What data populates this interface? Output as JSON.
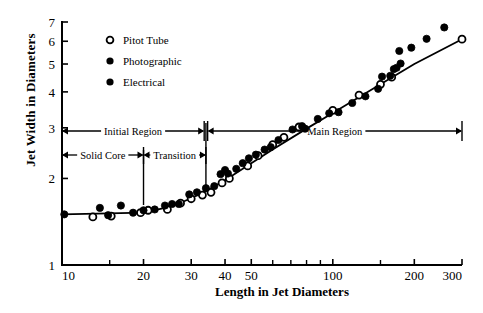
{
  "chart_data": {
    "type": "scatter",
    "title": "",
    "xlabel": "Length in Jet Diameters",
    "ylabel": "Jet Width in Diameters",
    "xscale": "log",
    "yscale": "log",
    "xlim": [
      10,
      300
    ],
    "ylim": [
      1,
      7
    ],
    "grid": false,
    "legend_position": "top-left",
    "xticks_labeled": [
      10,
      20,
      30,
      40,
      50,
      100,
      200,
      300
    ],
    "xticks_minor": [
      15,
      60,
      70,
      80,
      90,
      150
    ],
    "yticks_labeled": [
      1,
      2,
      3,
      4,
      5,
      6,
      7
    ],
    "xtick_labels": [
      "10",
      "20",
      "30",
      "40",
      "50",
      "100",
      "200",
      "300"
    ],
    "ytick_labels": [
      "1",
      "2",
      "3",
      "4",
      "5",
      "6",
      "7"
    ],
    "series": [
      {
        "name": "Pitot Tube",
        "marker": "open-circle",
        "color": "#000000",
        "points": [
          [
            13.0,
            1.47
          ],
          [
            15.2,
            1.48
          ],
          [
            19.5,
            1.52
          ],
          [
            20.8,
            1.55
          ],
          [
            24.5,
            1.56
          ],
          [
            27.4,
            1.64
          ],
          [
            30.0,
            1.7
          ],
          [
            33.0,
            1.75
          ],
          [
            35.5,
            1.79
          ],
          [
            39.0,
            1.93
          ],
          [
            41.5,
            2.0
          ],
          [
            48.5,
            2.21
          ],
          [
            53.0,
            2.4
          ],
          [
            60.0,
            2.62
          ],
          [
            66.0,
            2.78
          ],
          [
            75.0,
            3.02
          ],
          [
            100.0,
            3.45
          ],
          [
            125.0,
            3.9
          ],
          [
            150.0,
            4.25
          ],
          [
            165.0,
            4.5
          ],
          [
            300.0,
            6.1
          ]
        ]
      },
      {
        "name": "Photographic",
        "marker": "filled-circle",
        "color": "#000000",
        "points": [
          [
            10.2,
            1.5
          ],
          [
            13.8,
            1.58
          ],
          [
            14.8,
            1.49
          ],
          [
            16.5,
            1.61
          ],
          [
            18.3,
            1.52
          ],
          [
            20.0,
            1.55
          ],
          [
            22.0,
            1.56
          ],
          [
            24.0,
            1.61
          ],
          [
            25.5,
            1.63
          ],
          [
            27.0,
            1.63
          ],
          [
            29.5,
            1.76
          ],
          [
            31.5,
            1.79
          ],
          [
            34.0,
            1.85
          ],
          [
            36.5,
            1.88
          ],
          [
            38.5,
            2.07
          ],
          [
            40.0,
            2.14
          ],
          [
            41.0,
            2.08
          ],
          [
            44.0,
            2.16
          ],
          [
            46.5,
            2.26
          ],
          [
            49.0,
            2.35
          ],
          [
            52.0,
            2.42
          ],
          [
            56.0,
            2.52
          ],
          [
            59.0,
            2.57
          ],
          [
            63.0,
            2.72
          ],
          [
            71.0,
            2.96
          ],
          [
            77.0,
            3.04
          ],
          [
            79.0,
            2.98
          ]
        ]
      },
      {
        "name": "Electrical",
        "marker": "filled-circle",
        "color": "#000000",
        "points": [
          [
            88.0,
            3.22
          ],
          [
            97.0,
            3.37
          ],
          [
            105.0,
            3.4
          ],
          [
            118.0,
            3.66
          ],
          [
            132.0,
            3.86
          ],
          [
            147.0,
            4.1
          ],
          [
            152.0,
            4.52
          ],
          [
            163.0,
            4.55
          ],
          [
            168.0,
            4.8
          ],
          [
            172.0,
            4.85
          ],
          [
            178.0,
            5.02
          ],
          [
            176.0,
            5.55
          ],
          [
            195.0,
            5.7
          ],
          [
            222.0,
            6.12
          ],
          [
            258.0,
            6.7
          ]
        ]
      }
    ],
    "fit_line": {
      "name": "fitted-curve",
      "points": [
        [
          10.0,
          1.5
        ],
        [
          20.0,
          1.52
        ],
        [
          24.0,
          1.58
        ],
        [
          28.0,
          1.66
        ],
        [
          33.0,
          1.78
        ],
        [
          40.0,
          1.97
        ],
        [
          50.0,
          2.26
        ],
        [
          60.0,
          2.52
        ],
        [
          80.0,
          2.98
        ],
        [
          100.0,
          3.38
        ],
        [
          150.0,
          4.25
        ],
        [
          200.0,
          5.0
        ],
        [
          300.0,
          6.1
        ]
      ]
    },
    "annotations": [
      {
        "id": "initial-region",
        "label": "Initial Region",
        "from": 10,
        "to": 33.5,
        "row": "upper",
        "style": "double-arrow"
      },
      {
        "id": "main-region",
        "label": "Main Region",
        "from": 34.5,
        "to": 300,
        "row": "upper",
        "style": "double-arrow"
      },
      {
        "id": "solid-core",
        "label": "Solid Core",
        "from": 10,
        "to": 20,
        "row": "lower",
        "style": "double-arrow"
      },
      {
        "id": "transition",
        "label": "Transition",
        "from": 20,
        "to": 34,
        "row": "lower",
        "style": "double-arrow"
      }
    ],
    "dividers": [
      {
        "id": "divider-solid-core-transition",
        "x": 20
      },
      {
        "id": "divider-initial-main",
        "x": 34
      }
    ]
  },
  "legend": {
    "items": [
      {
        "label": "Pitot Tube",
        "marker": "open-circle"
      },
      {
        "label": "Photographic",
        "marker": "filled-circle"
      },
      {
        "label": "Electrical",
        "marker": "filled-circle"
      }
    ]
  },
  "axes": {
    "x_title": "Length in Jet Diameters",
    "y_title": "Jet Width in Diameters"
  },
  "colors": {
    "ink": "#000000",
    "background": "#ffffff"
  }
}
